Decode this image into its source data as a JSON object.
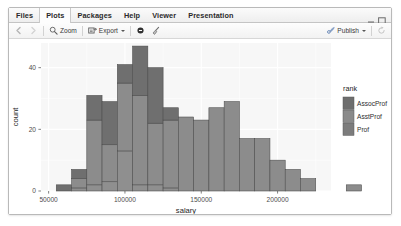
{
  "window": {
    "title_tabs": [
      {
        "label": "Files",
        "active": false
      },
      {
        "label": "Plots",
        "active": true
      },
      {
        "label": "Packages",
        "active": false
      },
      {
        "label": "Help",
        "active": false
      },
      {
        "label": "Viewer",
        "active": false
      },
      {
        "label": "Presentation",
        "active": false
      }
    ],
    "controls": [
      {
        "name": "minimize-button",
        "glyph": "minimize-icon"
      },
      {
        "name": "maximize-button",
        "glyph": "maximize-icon"
      }
    ]
  },
  "toolbar": {
    "back_icon": "back-arrow-icon",
    "forward_icon": "forward-arrow-icon",
    "zoom_label": "Zoom",
    "zoom_icon": "magnifier-icon",
    "export_label": "Export",
    "export_icon": "export-icon",
    "export_caret": "chevron-down-icon",
    "remove_icon": "remove-plot-icon",
    "clear_icon": "broom-clear-icon",
    "publish_label": "Publish",
    "publish_icon": "publish-icon",
    "publish_caret": "chevron-down-icon",
    "refresh_icon": "refresh-icon"
  },
  "chart_data": {
    "type": "bar",
    "subtype": "stacked-histogram",
    "title": "",
    "xlabel": "salary",
    "ylabel": "count",
    "xlim": [
      45000,
      235000
    ],
    "ylim": [
      0,
      48
    ],
    "xticks": [
      50000,
      100000,
      150000,
      200000
    ],
    "xticklabels": [
      "50000",
      "100000",
      "150000",
      "200000"
    ],
    "yticks": [
      0,
      20,
      40
    ],
    "yticklabels": [
      "0",
      "20",
      "40"
    ],
    "grid": true,
    "binwidth": 10000,
    "legend": {
      "title": "rank",
      "position": "right",
      "entries": [
        {
          "label": "AssocProf",
          "color": "#6e6e6e"
        },
        {
          "label": "AsstProf",
          "color": "#8a8a8a"
        },
        {
          "label": "Prof",
          "color": "#7c7c7c"
        }
      ]
    },
    "colors": {
      "panel_bg": "#f7f7f7",
      "grid": "#ffffff",
      "bar_fill": "#8c8c8c",
      "bar_stroke": "#4a4a4a",
      "bar_top": "#6f6f6f"
    },
    "bins": [
      {
        "x0": 55000,
        "x1": 65000,
        "total": 2,
        "segments": [
          {
            "name": "Prof",
            "value": 0
          },
          {
            "name": "AsstProf",
            "value": 0
          },
          {
            "name": "AssocProf",
            "value": 2
          }
        ]
      },
      {
        "x0": 65000,
        "x1": 75000,
        "total": 7,
        "segments": [
          {
            "name": "Prof",
            "value": 1
          },
          {
            "name": "AsstProf",
            "value": 3
          },
          {
            "name": "AssocProf",
            "value": 3
          }
        ]
      },
      {
        "x0": 75000,
        "x1": 85000,
        "total": 31,
        "segments": [
          {
            "name": "Prof",
            "value": 2
          },
          {
            "name": "AsstProf",
            "value": 21
          },
          {
            "name": "AssocProf",
            "value": 8
          }
        ]
      },
      {
        "x0": 85000,
        "x1": 95000,
        "total": 29,
        "segments": [
          {
            "name": "Prof",
            "value": 3
          },
          {
            "name": "AsstProf",
            "value": 12
          },
          {
            "name": "AssocProf",
            "value": 14
          }
        ]
      },
      {
        "x0": 95000,
        "x1": 105000,
        "total": 41,
        "segments": [
          {
            "name": "Prof",
            "value": 13
          },
          {
            "name": "AsstProf",
            "value": 22
          },
          {
            "name": "AssocProf",
            "value": 6
          }
        ]
      },
      {
        "x0": 105000,
        "x1": 115000,
        "total": 47,
        "segments": [
          {
            "name": "Prof",
            "value": 2
          },
          {
            "name": "AsstProf",
            "value": 29
          },
          {
            "name": "AssocProf",
            "value": 16
          }
        ]
      },
      {
        "x0": 115000,
        "x1": 125000,
        "total": 40,
        "segments": [
          {
            "name": "Prof",
            "value": 2
          },
          {
            "name": "AsstProf",
            "value": 20
          },
          {
            "name": "AssocProf",
            "value": 18
          }
        ]
      },
      {
        "x0": 125000,
        "x1": 135000,
        "total": 27,
        "segments": [
          {
            "name": "Prof",
            "value": 1
          },
          {
            "name": "AsstProf",
            "value": 22
          },
          {
            "name": "AssocProf",
            "value": 4
          }
        ]
      },
      {
        "x0": 135000,
        "x1": 145000,
        "total": 24,
        "segments": [
          {
            "name": "Prof",
            "value": 0
          },
          {
            "name": "AsstProf",
            "value": 24
          },
          {
            "name": "AssocProf",
            "value": 0
          }
        ]
      },
      {
        "x0": 145000,
        "x1": 155000,
        "total": 23,
        "segments": [
          {
            "name": "Prof",
            "value": 0
          },
          {
            "name": "AsstProf",
            "value": 23
          },
          {
            "name": "AssocProf",
            "value": 0
          }
        ]
      },
      {
        "x0": 155000,
        "x1": 165000,
        "total": 27,
        "segments": [
          {
            "name": "Prof",
            "value": 0
          },
          {
            "name": "AsstProf",
            "value": 27
          },
          {
            "name": "AssocProf",
            "value": 0
          }
        ]
      },
      {
        "x0": 165000,
        "x1": 175000,
        "total": 29,
        "segments": [
          {
            "name": "Prof",
            "value": 0
          },
          {
            "name": "AsstProf",
            "value": 29
          },
          {
            "name": "AssocProf",
            "value": 0
          }
        ]
      },
      {
        "x0": 175000,
        "x1": 185000,
        "total": 17,
        "segments": [
          {
            "name": "Prof",
            "value": 0
          },
          {
            "name": "AsstProf",
            "value": 17
          },
          {
            "name": "AssocProf",
            "value": 0
          }
        ]
      },
      {
        "x0": 185000,
        "x1": 195000,
        "total": 17,
        "segments": [
          {
            "name": "Prof",
            "value": 0
          },
          {
            "name": "AsstProf",
            "value": 17
          },
          {
            "name": "AssocProf",
            "value": 0
          }
        ]
      },
      {
        "x0": 195000,
        "x1": 205000,
        "total": 10,
        "segments": [
          {
            "name": "Prof",
            "value": 0
          },
          {
            "name": "AsstProf",
            "value": 10
          },
          {
            "name": "AssocProf",
            "value": 0
          }
        ]
      },
      {
        "x0": 205000,
        "x1": 215000,
        "total": 7,
        "segments": [
          {
            "name": "Prof",
            "value": 0
          },
          {
            "name": "AsstProf",
            "value": 7
          },
          {
            "name": "AssocProf",
            "value": 0
          }
        ]
      },
      {
        "x0": 215000,
        "x1": 225000,
        "total": 4,
        "segments": [
          {
            "name": "Prof",
            "value": 0
          },
          {
            "name": "AsstProf",
            "value": 4
          },
          {
            "name": "AssocProf",
            "value": 0
          }
        ]
      },
      {
        "x0": 245000,
        "x1": 255000,
        "total": 2,
        "segments": [
          {
            "name": "Prof",
            "value": 0
          },
          {
            "name": "AsstProf",
            "value": 2
          },
          {
            "name": "AssocProf",
            "value": 0
          }
        ]
      }
    ]
  }
}
